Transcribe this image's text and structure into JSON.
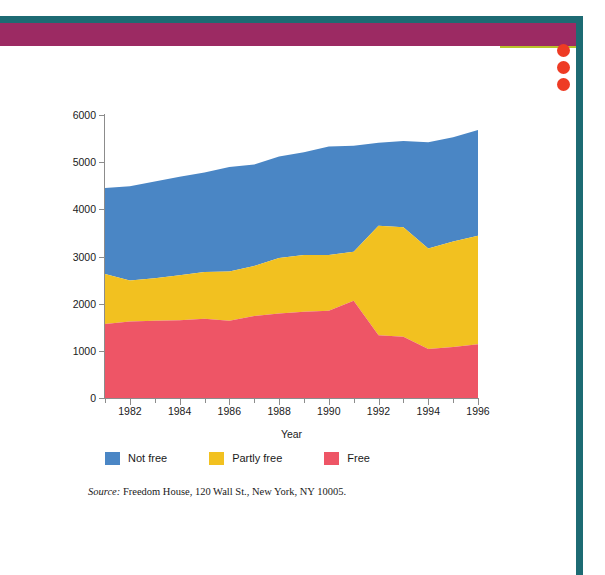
{
  "page": {
    "decoration": {
      "frame_color": "#1d6b73",
      "band_color": "#9c2a63",
      "accent_line_color": "#b9c22a",
      "dot_color": "#ee3b24",
      "dot_count": 3
    }
  },
  "source_note": {
    "label": "Source:",
    "text": " Freedom House, 120 Wall St., New York, NY 10005."
  },
  "legend": {
    "items": [
      {
        "label": "Not free",
        "color": "#4a86c5"
      },
      {
        "label": "Partly free",
        "color": "#f2c120"
      },
      {
        "label": "Free",
        "color": "#ee5566"
      }
    ]
  },
  "chart_data": {
    "type": "area",
    "stacked": true,
    "title": "",
    "xlabel": "Year",
    "ylabel": "World population (in millions)",
    "xlim": [
      1981,
      1996
    ],
    "ylim": [
      0,
      6000
    ],
    "grid": false,
    "legend_position": "bottom-left",
    "x": [
      1981,
      1982,
      1983,
      1984,
      1985,
      1986,
      1987,
      1988,
      1989,
      1990,
      1991,
      1992,
      1993,
      1994,
      1995,
      1996
    ],
    "xticks": [
      1982,
      1984,
      1986,
      1988,
      1990,
      1992,
      1994,
      1996
    ],
    "xtick_labels": [
      "1982",
      "1984",
      "1986",
      "1988",
      "1990",
      "1992",
      "1994",
      "1996"
    ],
    "xticks_minor": [
      1981,
      1983,
      1985,
      1987,
      1989,
      1991,
      1993,
      1995
    ],
    "yticks": [
      0,
      1000,
      2000,
      3000,
      4000,
      5000,
      6000
    ],
    "ytick_labels": [
      "0",
      "1000",
      "2000",
      "3000",
      "4000",
      "5000",
      "6000"
    ],
    "series": [
      {
        "name": "Free",
        "color": "#ee5566",
        "values": [
          1570,
          1620,
          1640,
          1650,
          1680,
          1640,
          1740,
          1790,
          1830,
          1850,
          2060,
          1330,
          1300,
          1040,
          1080,
          1140
        ]
      },
      {
        "name": "Partly free",
        "color": "#f2c120",
        "values": [
          1060,
          870,
          900,
          950,
          990,
          1040,
          1060,
          1180,
          1200,
          1180,
          1040,
          2320,
          2320,
          2130,
          2240,
          2300
        ]
      },
      {
        "name": "Not free",
        "color": "#4a86c5",
        "values": [
          1820,
          2000,
          2050,
          2090,
          2110,
          2220,
          2150,
          2150,
          2180,
          2300,
          2250,
          1760,
          1830,
          2250,
          2210,
          2240
        ]
      }
    ],
    "totals": [
      4450,
      4490,
      4590,
      4690,
      4780,
      4900,
      4950,
      5120,
      5210,
      5330,
      5350,
      5410,
      5450,
      5420,
      5530,
      5680
    ]
  }
}
